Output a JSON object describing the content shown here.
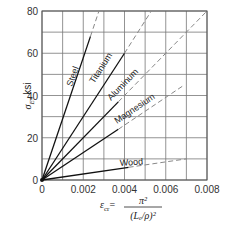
{
  "chart_data": {
    "type": "line",
    "title": "",
    "xlabel": "ε_cr = π² / (L_e/ρ)²",
    "ylabel": "σ_E, ksi",
    "xlim": [
      0,
      0.008
    ],
    "ylim": [
      0,
      80
    ],
    "x_ticks": [
      "0",
      "0.002",
      "0.004",
      "0.006",
      "0.008"
    ],
    "y_ticks": [
      "0",
      "20",
      "40",
      "60",
      "80"
    ],
    "grid": true,
    "grid_step": {
      "x": 0.001,
      "y": 10
    },
    "legend": "inline labels on lines",
    "series": [
      {
        "name": "Steel",
        "slope_ksi": 29000,
        "solid": [
          [
            0,
            0
          ],
          [
            0.00235,
            68
          ]
        ],
        "dashed": [
          [
            0.00235,
            68
          ],
          [
            0.00276,
            80
          ]
        ]
      },
      {
        "name": "Titanium",
        "slope_ksi": 15000,
        "solid": [
          [
            0,
            0
          ],
          [
            0.004,
            60
          ]
        ],
        "dashed": [
          [
            0.004,
            60
          ],
          [
            0.0053,
            80
          ]
        ]
      },
      {
        "name": "Aluminum",
        "slope_ksi": 10000,
        "solid": [
          [
            0,
            0
          ],
          [
            0.0037,
            37
          ]
        ],
        "dashed": [
          [
            0.0037,
            37
          ],
          [
            0.008,
            80
          ]
        ]
      },
      {
        "name": "Magnesium",
        "slope_ksi": 6500,
        "solid": [
          [
            0,
            0
          ],
          [
            0.0037,
            24
          ]
        ],
        "dashed": [
          [
            0.0037,
            24
          ],
          [
            0.0069,
            45
          ]
        ]
      },
      {
        "name": "Wood",
        "slope_ksi": 1450,
        "solid": [
          [
            0,
            0
          ],
          [
            0.0042,
            6
          ]
        ],
        "dashed": [
          [
            0.0042,
            6
          ],
          [
            0.007,
            10
          ]
        ]
      }
    ]
  },
  "axis": {
    "x_label_prefix": "ε",
    "x_label_sub": "cr",
    "x_label_eq": "=",
    "x_label_num": "π²",
    "x_label_den": "(Lₑ/ρ)²",
    "y_label": "σ",
    "y_label_sub": "E",
    "y_label_unit": ", ksi"
  },
  "labels": {
    "steel": "Steel",
    "titanium": "Titanium",
    "aluminum": "Aluminum",
    "magnesium": "Magnesium",
    "wood": "Wood"
  }
}
